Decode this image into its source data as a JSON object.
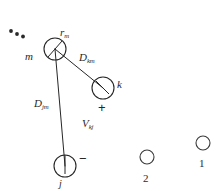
{
  "figure": {
    "background_color": "#ffffff",
    "stroke_color": "#262626",
    "width": 220,
    "height": 191,
    "nodes": [
      {
        "id": "m",
        "label": "m",
        "cx": 55,
        "cy": 49,
        "r": 11
      },
      {
        "id": "k",
        "label": "k",
        "cx": 103,
        "cy": 88,
        "r": 11
      },
      {
        "id": "j",
        "label": "j",
        "cx": 65,
        "cy": 166,
        "r": 11
      },
      {
        "id": "site2",
        "label": "2",
        "cx": 147,
        "cy": 157,
        "r": 7
      },
      {
        "id": "site1",
        "label": "1",
        "cx": 203,
        "cy": 143,
        "r": 7
      }
    ],
    "labels": {
      "r_m": {
        "base": "r",
        "sub": "m"
      },
      "m": {
        "base": "m",
        "sub": ""
      },
      "D_km": {
        "base": "D",
        "sub": "km"
      },
      "k": {
        "base": "k",
        "sub": ""
      },
      "D_jm": {
        "base": "D",
        "sub": "jm"
      },
      "V_kj": {
        "base": "V",
        "sub": "kj"
      },
      "j": {
        "base": "j",
        "sub": ""
      },
      "site_2": "2",
      "site_1": "1"
    },
    "signs": {
      "k_charge": "+",
      "j_charge": "−"
    },
    "ellipsis": {
      "name": "continuation-dots",
      "dots": [
        {
          "cx": 11,
          "cy": 31,
          "r": 1.8
        },
        {
          "cx": 17,
          "cy": 34,
          "r": 1.8
        },
        {
          "cx": 23,
          "cy": 36,
          "r": 1.8
        }
      ]
    },
    "connections": [
      {
        "from": "m",
        "to": "k",
        "label": "D_km"
      },
      {
        "from": "m",
        "to": "j",
        "label": "D_jm"
      }
    ]
  }
}
